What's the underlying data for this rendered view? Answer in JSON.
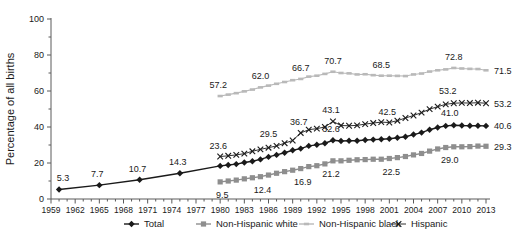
{
  "chart_data": {
    "type": "line",
    "title": "",
    "xlabel": "",
    "ylabel": "Percentage of all births",
    "ylim": [
      0,
      100
    ],
    "xlim": [
      1959,
      2013
    ],
    "yticks": [
      0,
      20,
      40,
      60,
      80,
      100
    ],
    "yminorticks": [
      10,
      30,
      50,
      70,
      90
    ],
    "xticks": [
      1959,
      1962,
      1965,
      1968,
      1971,
      1974,
      1977,
      1980,
      1983,
      1986,
      1989,
      1992,
      1995,
      1998,
      2001,
      2004,
      2007,
      2010,
      2013
    ],
    "grid": false,
    "legend_position": "bottom",
    "series": [
      {
        "name": "Total",
        "marker": "diamond",
        "color": "#1a1a1a",
        "x": [
          1960,
          1965,
          1970,
          1975,
          1980,
          1981,
          1982,
          1983,
          1984,
          1985,
          1986,
          1987,
          1988,
          1989,
          1990,
          1991,
          1992,
          1993,
          1994,
          1995,
          1996,
          1997,
          1998,
          1999,
          2000,
          2001,
          2002,
          2003,
          2004,
          2005,
          2006,
          2007,
          2008,
          2009,
          2010,
          2011,
          2012,
          2013
        ],
        "values": [
          5.3,
          7.7,
          10.7,
          14.3,
          18.4,
          18.9,
          19.4,
          20.3,
          21.0,
          22.0,
          23.4,
          24.5,
          25.7,
          27.1,
          28.0,
          29.5,
          30.1,
          31.0,
          32.6,
          32.2,
          32.4,
          32.4,
          32.8,
          33.0,
          33.2,
          33.5,
          34.0,
          34.6,
          35.8,
          36.9,
          38.5,
          39.7,
          40.6,
          41.0,
          40.8,
          40.7,
          40.7,
          40.6
        ],
        "labeled_points": [
          {
            "x": 1960,
            "y": 5.3,
            "label": "5.3"
          },
          {
            "x": 1965,
            "y": 7.7,
            "label": "7.7"
          },
          {
            "x": 1970,
            "y": 10.7,
            "label": "10.7"
          },
          {
            "x": 1975,
            "y": 14.3,
            "label": "14.3"
          },
          {
            "x": 1994,
            "y": 32.6,
            "label": "32.6"
          },
          {
            "x": 2009,
            "y": 41.0,
            "label": "41.0"
          },
          {
            "x": 2013,
            "y": 40.6,
            "label": "40.6"
          }
        ]
      },
      {
        "name": "Non-Hispanic white",
        "marker": "square",
        "color": "#8e8e8e",
        "x": [
          1980,
          1981,
          1982,
          1983,
          1984,
          1985,
          1986,
          1987,
          1988,
          1989,
          1990,
          1991,
          1992,
          1993,
          1994,
          1995,
          1996,
          1997,
          1998,
          1999,
          2000,
          2001,
          2002,
          2003,
          2004,
          2005,
          2006,
          2007,
          2008,
          2009,
          2010,
          2011,
          2012,
          2013
        ],
        "values": [
          9.5,
          10.0,
          10.5,
          11.2,
          11.8,
          12.4,
          13.3,
          14.3,
          15.2,
          16.0,
          16.9,
          18.0,
          18.5,
          19.5,
          21.2,
          21.2,
          21.5,
          21.8,
          21.9,
          22.1,
          22.1,
          22.5,
          23.0,
          23.6,
          24.5,
          25.3,
          26.6,
          27.8,
          28.6,
          29.0,
          29.0,
          29.1,
          29.4,
          29.3
        ],
        "labeled_points": [
          {
            "x": 1980,
            "y": 9.5,
            "label": "9.5"
          },
          {
            "x": 1985,
            "y": 12.4,
            "label": "12.4"
          },
          {
            "x": 1990,
            "y": 16.9,
            "label": "16.9"
          },
          {
            "x": 1994,
            "y": 21.2,
            "label": "21.2"
          },
          {
            "x": 2001,
            "y": 22.5,
            "label": "22.5"
          },
          {
            "x": 2009,
            "y": 29.0,
            "label": "29.0"
          },
          {
            "x": 2013,
            "y": 29.3,
            "label": "29.3"
          }
        ]
      },
      {
        "name": "Non-Hispanic black",
        "marker": "dash",
        "color": "#b9b9b9",
        "x": [
          1980,
          1981,
          1982,
          1983,
          1984,
          1985,
          1986,
          1987,
          1988,
          1989,
          1990,
          1991,
          1992,
          1993,
          1994,
          1995,
          1996,
          1997,
          1998,
          1999,
          2000,
          2001,
          2002,
          2003,
          2004,
          2005,
          2006,
          2007,
          2008,
          2009,
          2010,
          2011,
          2012,
          2013
        ],
        "values": [
          57.2,
          58.0,
          58.8,
          59.8,
          60.8,
          62.0,
          63.0,
          64.0,
          65.0,
          66.0,
          66.7,
          68.0,
          68.5,
          69.5,
          70.7,
          70.0,
          69.8,
          69.2,
          69.3,
          68.8,
          68.5,
          68.5,
          68.4,
          68.3,
          69.2,
          69.7,
          70.8,
          71.5,
          72.0,
          72.8,
          72.5,
          72.3,
          72.2,
          71.5
        ],
        "labeled_points": [
          {
            "x": 1980,
            "y": 57.2,
            "label": "57.2"
          },
          {
            "x": 1985,
            "y": 62.0,
            "label": "62.0"
          },
          {
            "x": 1990,
            "y": 66.7,
            "label": "66.7"
          },
          {
            "x": 1994,
            "y": 70.7,
            "label": "70.7"
          },
          {
            "x": 2000,
            "y": 68.5,
            "label": "68.5"
          },
          {
            "x": 2009,
            "y": 72.8,
            "label": "72.8"
          },
          {
            "x": 2013,
            "y": 71.5,
            "label": "71.5"
          }
        ]
      },
      {
        "name": "Hispanic",
        "marker": "x",
        "color": "#1a1a1a",
        "x": [
          1980,
          1981,
          1982,
          1983,
          1984,
          1985,
          1986,
          1987,
          1988,
          1989,
          1990,
          1991,
          1992,
          1993,
          1994,
          1995,
          1996,
          1997,
          1998,
          1999,
          2000,
          2001,
          2002,
          2003,
          2004,
          2005,
          2006,
          2007,
          2008,
          2009,
          2010,
          2011,
          2012,
          2013
        ],
        "values": [
          23.6,
          24.0,
          24.5,
          25.2,
          26.5,
          27.6,
          28.5,
          29.5,
          31.0,
          32.5,
          36.7,
          38.5,
          39.1,
          40.0,
          43.1,
          40.8,
          40.7,
          40.9,
          41.6,
          42.2,
          42.7,
          42.5,
          43.5,
          45.0,
          46.4,
          48.0,
          49.9,
          51.3,
          52.6,
          53.2,
          53.4,
          53.3,
          53.5,
          53.2
        ],
        "labeled_points": [
          {
            "x": 1980,
            "y": 23.6,
            "label": "23.6"
          },
          {
            "x": 1987,
            "y": 29.5,
            "label": "29.5"
          },
          {
            "x": 1990,
            "y": 36.7,
            "label": "36.7"
          },
          {
            "x": 1994,
            "y": 43.1,
            "label": "43.1"
          },
          {
            "x": 2001,
            "y": 42.5,
            "label": "42.5"
          },
          {
            "x": 2009,
            "y": 53.2,
            "label": "53.2"
          },
          {
            "x": 2013,
            "y": 53.2,
            "label": "53.2"
          }
        ]
      }
    ],
    "end_labels": [
      {
        "series": "Non-Hispanic black",
        "label": "71.5"
      },
      {
        "series": "Hispanic",
        "label": "53.2"
      },
      {
        "series": "Total",
        "label": "40.6"
      },
      {
        "series": "Non-Hispanic white",
        "label": "29.3"
      }
    ]
  },
  "legend": {
    "items": [
      {
        "label": "Total",
        "marker": "diamond",
        "color": "#1a1a1a"
      },
      {
        "label": "Non-Hispanic white",
        "marker": "square",
        "color": "#8e8e8e"
      },
      {
        "label": "Non-Hispanic black",
        "marker": "dash",
        "color": "#b9b9b9"
      },
      {
        "label": "Hispanic",
        "marker": "x",
        "color": "#1a1a1a"
      }
    ]
  }
}
